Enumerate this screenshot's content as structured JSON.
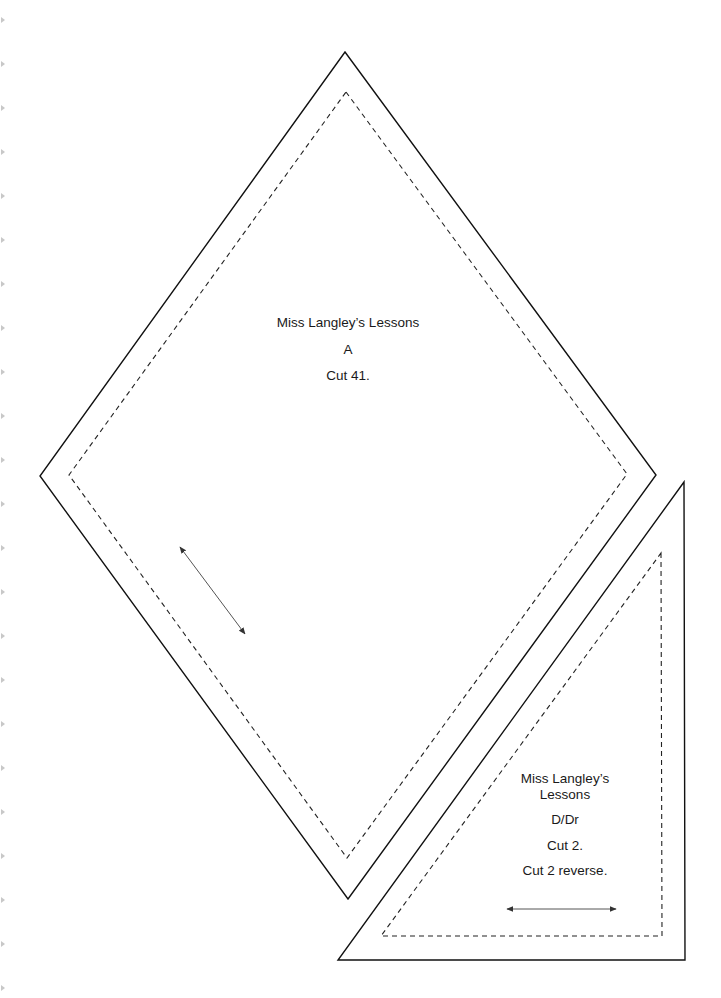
{
  "pieces": [
    {
      "id": "A",
      "shape": "diamond",
      "lines": [
        "Miss Langley’s Lessons",
        "A",
        "Cut 41."
      ]
    },
    {
      "id": "D/Dr",
      "shape": "right-triangle",
      "lines": [
        "Miss Langley’s",
        "Lessons",
        "D/Dr",
        "Cut 2.",
        "Cut 2 reverse."
      ]
    }
  ],
  "colors": {
    "outline": "#111111",
    "seam_line": "#222222",
    "grain_arrow": "#555555",
    "edge_marks": "#c8c8c8"
  },
  "icons": {
    "grainline_a": "double-arrow-diagonal",
    "grainline_d": "double-arrow-horizontal",
    "edge_marks": "binder-edge-triangle"
  }
}
